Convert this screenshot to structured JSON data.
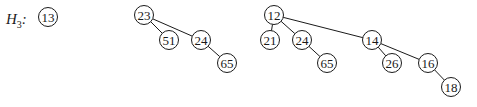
{
  "heap": {
    "label": "H",
    "label_subscript": "3",
    "label_suffix": ":",
    "trees": [
      {
        "name": "B0",
        "root": "13",
        "nodes": [
          {
            "id": "a13",
            "value": "13",
            "x": 48,
            "y": 17
          }
        ],
        "edges": []
      },
      {
        "name": "B2",
        "root": "23",
        "nodes": [
          {
            "id": "b23",
            "value": "23",
            "x": 144,
            "y": 15
          },
          {
            "id": "b51",
            "value": "51",
            "x": 169,
            "y": 40
          },
          {
            "id": "b24",
            "value": "24",
            "x": 201,
            "y": 40
          },
          {
            "id": "b65",
            "value": "65",
            "x": 227,
            "y": 63
          }
        ],
        "edges": [
          [
            "b23",
            "b51"
          ],
          [
            "b23",
            "b24"
          ],
          [
            "b24",
            "b65"
          ]
        ]
      },
      {
        "name": "B3",
        "root": "12",
        "nodes": [
          {
            "id": "c12",
            "value": "12",
            "x": 274,
            "y": 15
          },
          {
            "id": "c21",
            "value": "21",
            "x": 270,
            "y": 40
          },
          {
            "id": "c24",
            "value": "24",
            "x": 302,
            "y": 40
          },
          {
            "id": "c65",
            "value": "65",
            "x": 327,
            "y": 63
          },
          {
            "id": "c14",
            "value": "14",
            "x": 372,
            "y": 40
          },
          {
            "id": "c26",
            "value": "26",
            "x": 392,
            "y": 63
          },
          {
            "id": "c16",
            "value": "16",
            "x": 428,
            "y": 63
          },
          {
            "id": "c18",
            "value": "18",
            "x": 451,
            "y": 87
          }
        ],
        "edges": [
          [
            "c12",
            "c21"
          ],
          [
            "c12",
            "c24"
          ],
          [
            "c12",
            "c14"
          ],
          [
            "c24",
            "c65"
          ],
          [
            "c14",
            "c26"
          ],
          [
            "c14",
            "c16"
          ],
          [
            "c16",
            "c18"
          ]
        ]
      }
    ]
  }
}
